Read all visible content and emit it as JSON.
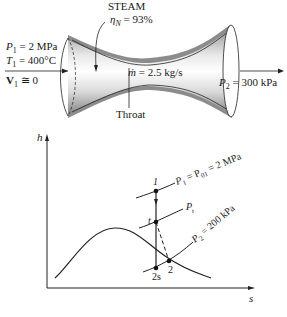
{
  "nozzle": {
    "fluid_label": "STEAM",
    "efficiency_symbol": "η",
    "efficiency_sub": "N",
    "efficiency_value": " = 93%",
    "inlet": {
      "p_sym": "P",
      "p_sub": "1",
      "p_val": " = 2 MPa",
      "t_sym": "T",
      "t_sub": "1",
      "t_val": " = 400°C",
      "v_sym": "V",
      "v_sub": "1",
      "v_val": " ≅ 0"
    },
    "mass_flow": {
      "sym": "ṁ",
      "val": " = 2.5 kg/s"
    },
    "throat_label": "Throat",
    "outlet": {
      "p_sym": "P",
      "p_sub": "2",
      "p_val": " = 300 kPa"
    }
  },
  "hs_diagram": {
    "y_axis_label": "h",
    "x_axis_label": "s",
    "isobars": [
      {
        "label_main": "P",
        "label_sub": "1",
        "label_rest": " = P",
        "label_sub2": "01",
        "label_rest2": " = 2 MPa"
      },
      {
        "label_main": "P",
        "label_sub": "t",
        "label_rest": ""
      },
      {
        "label_main": "P",
        "label_sub": "2",
        "label_rest": " = 200 kPa"
      }
    ],
    "points": {
      "p1": "1",
      "pt": "t",
      "p2": "2",
      "p2s": "2s"
    }
  },
  "colors": {
    "ink": "#1a1a1a",
    "nozzle_wall": "#8a8a8a",
    "nozzle_inner": "#e6e6e6"
  }
}
